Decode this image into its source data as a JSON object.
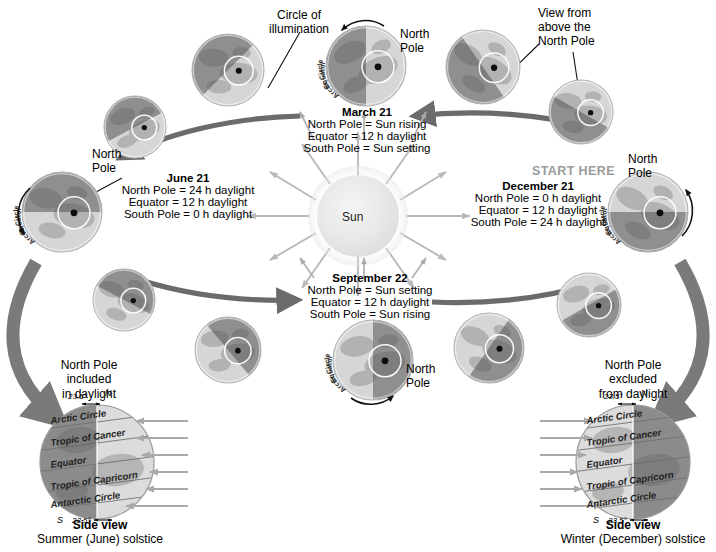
{
  "diagram": {
    "title_center": "Sun",
    "start_here": "START HERE",
    "annotations": {
      "circle_of_illumination": "Circle of\nillumination",
      "view_from_above": "View from\nabove the\nNorth Pole",
      "north_pole": "North\nPole"
    },
    "globe_ring_labels": {
      "equator": "Equator",
      "arctic_circle": "Arctic Circle",
      "north_pole_dot": "north-pole-dot"
    },
    "seasons": [
      {
        "id": "march",
        "title": "March 21",
        "lines": [
          "North Pole = Sun rising",
          "Equator = 12 h daylight",
          "South Pole = Sun setting"
        ]
      },
      {
        "id": "june",
        "title": "June 21",
        "lines": [
          "North Pole = 24 h daylight",
          "Equator = 12 h daylight",
          "South Pole = 0 h daylight"
        ]
      },
      {
        "id": "september",
        "title": "September 22",
        "lines": [
          "North Pole = Sun setting",
          "Equator = 12 h daylight",
          "South Pole = Sun rising"
        ]
      },
      {
        "id": "december",
        "title": "December 21",
        "lines": [
          "North Pole = 0 h daylight",
          "Equator = 12 h daylight",
          "South Pole = 24 h daylight"
        ]
      }
    ],
    "side_views": [
      {
        "id": "summer",
        "note": "North Pole\nincluded\nin daylight",
        "caption_bold": "Side view",
        "caption_normal": "Summer (June) solstice",
        "tilt_top": "23.5",
        "tilt_bottom": "23.5",
        "pole_north": "N",
        "pole_south": "S",
        "bands": [
          "Arctic Circle",
          "Tropic of Cancer",
          "Equator",
          "Tropic of Capricorn",
          "Antarctic Circle"
        ],
        "lit_side": "right"
      },
      {
        "id": "winter",
        "note": "North Pole\nexcluded\nfrom daylight",
        "caption_bold": "Side view",
        "caption_normal": "Winter (December) solstice",
        "tilt_top": "23.5",
        "tilt_bottom": "23.5",
        "pole_north": "N",
        "pole_south": "S",
        "bands": [
          "Arctic Circle",
          "Tropic of Cancer",
          "Equator",
          "Tropic of Capricorn",
          "Antarctic Circle"
        ],
        "lit_side": "left"
      }
    ],
    "colors": {
      "orbit_arrow": "#6b6b6b",
      "sun_ray": "#b9b9b9",
      "sun_core": "#ededed",
      "globe_light": "#d6d6d6",
      "globe_dark": "#8f8f8f",
      "text": "#000000",
      "start_here": "#9b9b9b",
      "big_arrow": "#7a7a7a",
      "ray_small": "#b0b0b0"
    },
    "globes": [
      {
        "id": "g-march",
        "cx": 366,
        "cy": 66,
        "r": 40,
        "angle": 0,
        "label": "march-globe"
      },
      {
        "id": "g-june",
        "cx": 62,
        "cy": 212,
        "r": 40,
        "angle": 90,
        "label": "june-globe"
      },
      {
        "id": "g-september",
        "cx": 373,
        "cy": 360,
        "r": 40,
        "angle": 180,
        "label": "september-globe"
      },
      {
        "id": "g-december",
        "cx": 648,
        "cy": 212,
        "r": 40,
        "angle": 270,
        "label": "december-globe"
      },
      {
        "id": "g-i1",
        "cx": 228,
        "cy": 70,
        "r": 36,
        "angle": 45,
        "label": "intermediate-globe"
      },
      {
        "id": "g-i2",
        "cx": 135,
        "cy": 127,
        "r": 31,
        "angle": 62,
        "label": "intermediate-globe"
      },
      {
        "id": "g-i3",
        "cx": 124,
        "cy": 300,
        "r": 31,
        "angle": 118,
        "label": "intermediate-globe"
      },
      {
        "id": "g-i4",
        "cx": 228,
        "cy": 350,
        "r": 33,
        "angle": 140,
        "label": "intermediate-globe"
      },
      {
        "id": "g-i5",
        "cx": 483,
        "cy": 67,
        "r": 37,
        "angle": 325,
        "label": "intermediate-globe"
      },
      {
        "id": "g-i6",
        "cx": 581,
        "cy": 112,
        "r": 32,
        "angle": 300,
        "label": "intermediate-globe"
      },
      {
        "id": "g-i7",
        "cx": 589,
        "cy": 305,
        "r": 32,
        "angle": 240,
        "label": "intermediate-globe"
      },
      {
        "id": "g-i8",
        "cx": 489,
        "cy": 348,
        "r": 35,
        "angle": 215,
        "label": "intermediate-globe"
      }
    ]
  }
}
